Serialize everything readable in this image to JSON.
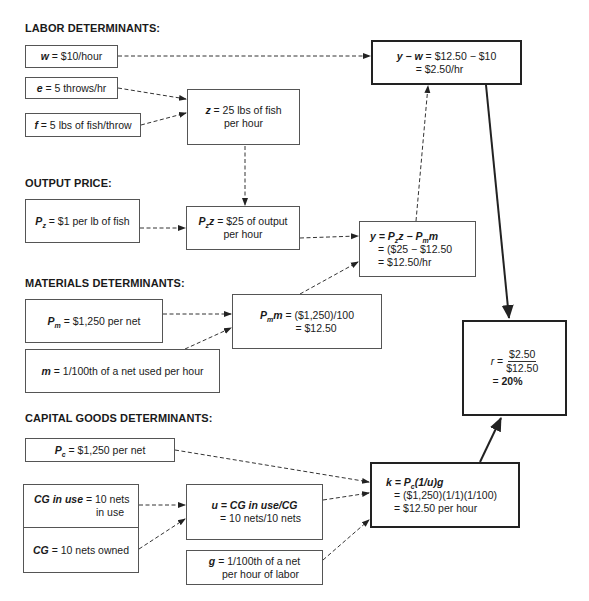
{
  "sections": {
    "labor": "LABOR DETERMINANTS:",
    "output": "OUTPUT PRICE:",
    "materials": "MATERIALS DETERMINANTS:",
    "capital": "CAPITAL GOODS DETERMINANTS:"
  },
  "boxes": {
    "w": {
      "var": "w",
      "eq": " = $10/hour"
    },
    "e": {
      "var": "e",
      "eq": " = 5 throws/hr"
    },
    "f": {
      "var": "f",
      "eq": " = 5 lbs of fish/throw"
    },
    "z": {
      "var": "z",
      "line1": " = 25 lbs of fish",
      "line2": "per hour"
    },
    "yw": {
      "lhs": "y − w",
      "line1": " = $12.50 − $10",
      "line2": "= $2.50/hr"
    },
    "pz": {
      "var": "P",
      "sub": "z",
      "eq": " = $1 per lb of fish"
    },
    "pzz": {
      "var": "P",
      "sub": "z",
      "var2": "z",
      "line1": " = $25 of output",
      "line2": "per hour"
    },
    "y": {
      "lhs": "y = P",
      "sub1": "z",
      "mid": "z − P",
      "sub2": "m",
      "end": "m",
      "line2": "= ($25 − $12.50",
      "line3": "= $12.50/hr"
    },
    "pm": {
      "var": "P",
      "sub": "m",
      "eq": " = $1,250 per net"
    },
    "pmm": {
      "var": "P",
      "sub": "m",
      "var2": "m",
      "line1": " = ($1,250)/100",
      "line2": "= $12.50"
    },
    "m": {
      "var": "m",
      "eq": " = 1/100th of a net used per hour"
    },
    "r": {
      "var": "r",
      "eq": " = ",
      "num": "$2.50",
      "den": "$12.50",
      "line2": "= ",
      "result": "20%"
    },
    "pc": {
      "var": "P",
      "sub": "c",
      "eq": " = $1,250 per net"
    },
    "cginuse": {
      "var": "CG in use",
      "line1": " = 10 nets",
      "line2": "in use"
    },
    "cg": {
      "var": "CG",
      "eq": " = 10 nets owned"
    },
    "u": {
      "lhs": "u = CG in use/CG",
      "line2": "= 10 nets/10 nets"
    },
    "g": {
      "var": "g",
      "line1": " = 1/100th of a net",
      "line2": "per hour of labor"
    },
    "k": {
      "lhs": "k = P",
      "sub": "c",
      "rhs": "(1/u)g",
      "line2": "= ($1,250)(1/1)(1/100)",
      "line3": "= $12.50 per hour"
    }
  },
  "colors": {
    "line": "#222222",
    "box_border": "#555555",
    "text": "#1a1a1a"
  }
}
